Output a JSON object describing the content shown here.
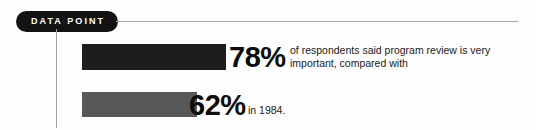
{
  "badge": {
    "label": "DATA POINT",
    "background_color": "#131313",
    "text_color": "#ffffff"
  },
  "rules": {
    "header_rule_color": "#a8a8a8",
    "vertical_rule_color": "#a3a3a3"
  },
  "stats": [
    {
      "value": "78%",
      "caption": "of respondents said program review is very important, compared with",
      "bar_color": "#1d1d1d"
    },
    {
      "value": "62%",
      "caption": "in 1984.",
      "bar_color": "#585858"
    }
  ],
  "chart_data": {
    "type": "bar",
    "title": "DATA POINT",
    "categories": [
      "Current",
      "1984"
    ],
    "values": [
      78,
      62
    ],
    "value_labels": [
      "78%",
      "62%"
    ],
    "orientation": "horizontal",
    "xlabel": "",
    "ylabel": "",
    "xlim": [
      0,
      100
    ],
    "grid": false,
    "legend": "none",
    "series": [
      {
        "name": "Respondents saying program review is very important",
        "values": [
          78,
          62
        ]
      }
    ],
    "annotations": [
      "of respondents said program review is very important, compared with",
      "in 1984."
    ],
    "colors": [
      "#1d1d1d",
      "#585858"
    ]
  }
}
